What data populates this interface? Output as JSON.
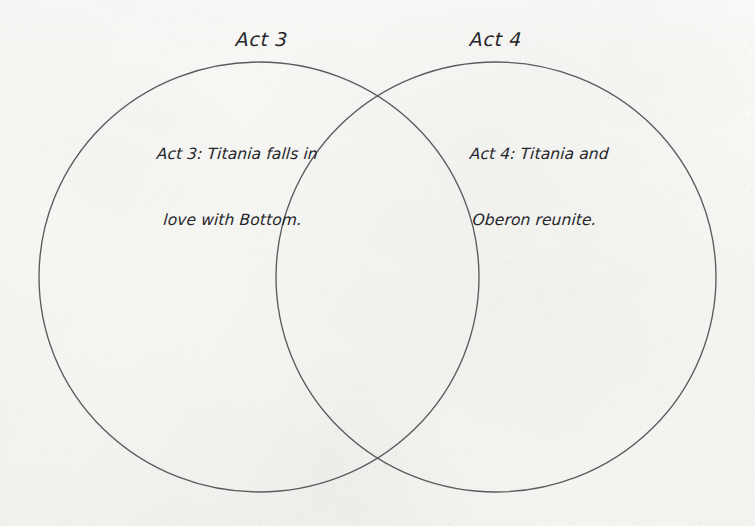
{
  "canvas": {
    "width": 755,
    "height": 526,
    "background_color": "#f7f7f5",
    "stroke_color": "#5a5a60",
    "text_color": "#25252a"
  },
  "diagram": {
    "type": "venn",
    "sets": [
      {
        "id": "left",
        "title": "Act 3",
        "body_lines": [
          "Act 3: Titania falls in",
          "love with Bottom."
        ],
        "body_text": "Act 3: Titania falls in love with Bottom.",
        "ellipse": {
          "cx": 259,
          "cy": 277,
          "rx": 220,
          "ry": 215
        }
      },
      {
        "id": "right",
        "title": "Act 4",
        "body_lines": [
          "Act 4: Titania and",
          "Oberon reunite."
        ],
        "body_text": "Act 4: Titania and Oberon reunite.",
        "ellipse": {
          "cx": 496,
          "cy": 277,
          "rx": 220,
          "ry": 215
        }
      }
    ],
    "intersection": {
      "top_point": {
        "x": 378,
        "y": 92
      },
      "bottom_point": {
        "x": 378,
        "y": 462
      },
      "body_lines": []
    }
  }
}
